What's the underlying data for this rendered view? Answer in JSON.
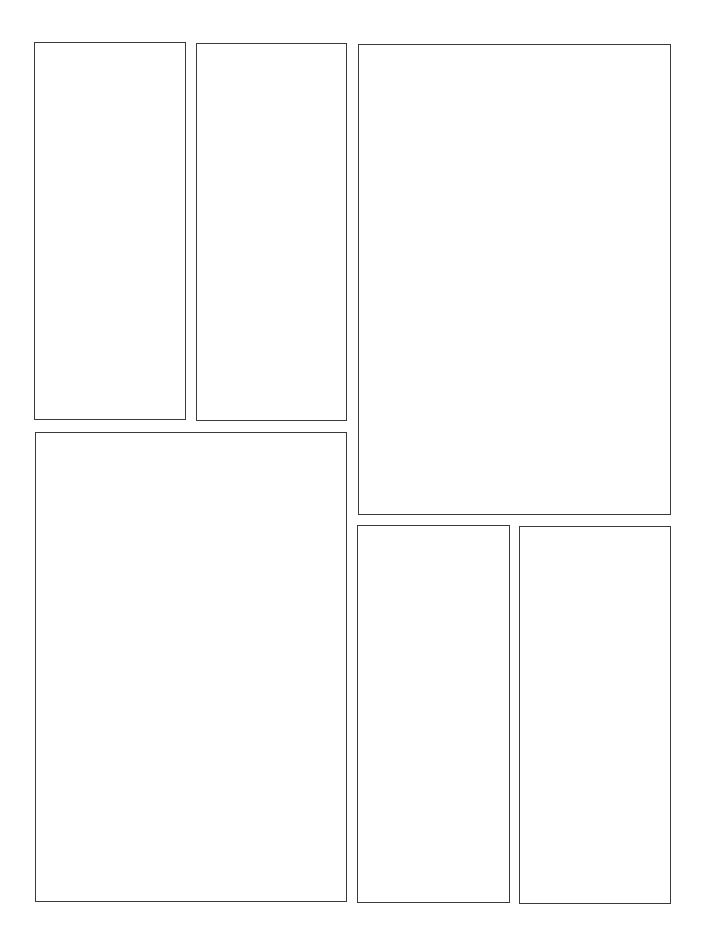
{
  "page": {
    "type": "comic-panel-template",
    "background": "#ffffff",
    "border_color": "#3a3a3a",
    "panel_count": 7
  },
  "panels": [
    {
      "id": 1,
      "label": "panel-1",
      "x": 34,
      "y": 42,
      "w": 152,
      "h": 378
    },
    {
      "id": 2,
      "label": "panel-2",
      "x": 196,
      "y": 43,
      "w": 151,
      "h": 378
    },
    {
      "id": 3,
      "label": "panel-3",
      "x": 358,
      "y": 44,
      "w": 313,
      "h": 471
    },
    {
      "id": 4,
      "label": "panel-4",
      "x": 35,
      "y": 432,
      "w": 312,
      "h": 470
    },
    {
      "id": 5,
      "label": "panel-5",
      "x": 357,
      "y": 525,
      "w": 153,
      "h": 378
    },
    {
      "id": 6,
      "label": "panel-6",
      "x": 519,
      "y": 526,
      "w": 152,
      "h": 378
    }
  ]
}
